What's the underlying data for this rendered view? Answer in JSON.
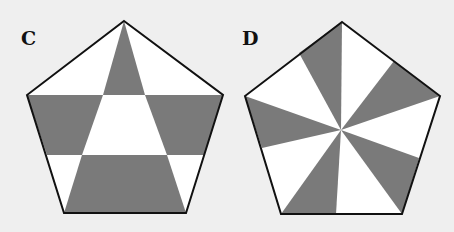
{
  "colors": {
    "background": "#efefef",
    "shaded": "#7a7a7a",
    "unshaded": "#ffffff",
    "outline": "#111111"
  },
  "figures": [
    {
      "label": "C",
      "shape": "regular pentagon",
      "description": "Pentagon divided by two horizontal lines and two lines from the top vertex to the bottom corners; shaded regions alternate in a checkerboard pattern",
      "vertices": [
        [
          124,
          21
        ],
        [
          223,
          95
        ],
        [
          186,
          213
        ],
        [
          64,
          213
        ],
        [
          27,
          95
        ]
      ],
      "shaded_regions": [
        [
          [
            124,
            21
          ],
          [
            145,
            95
          ],
          [
            103,
            95
          ]
        ],
        [
          [
            27,
            95
          ],
          [
            103,
            95
          ],
          [
            82,
            155
          ],
          [
            47,
            155
          ]
        ],
        [
          [
            145,
            95
          ],
          [
            223,
            95
          ],
          [
            204,
            155
          ],
          [
            167,
            155
          ]
        ],
        [
          [
            82,
            155
          ],
          [
            167,
            155
          ],
          [
            186,
            213
          ],
          [
            64,
            213
          ]
        ]
      ]
    },
    {
      "label": "D",
      "shape": "regular pentagon",
      "description": "Pentagon divided into wedges radiating from the center; five gray wedges each span from a vertex (or edge point) to a point partway along the adjacent edge, forming a pinwheel pattern",
      "vertices": [
        [
          342,
          22
        ],
        [
          440,
          96
        ],
        [
          402,
          214
        ],
        [
          281,
          214
        ],
        [
          245,
          96
        ]
      ],
      "center": [
        341,
        130
      ],
      "shaded_regions": [
        [
          [
            341,
            130
          ],
          [
            342,
            22
          ],
          [
            299,
            53
          ]
        ],
        [
          [
            341,
            130
          ],
          [
            440,
            96
          ],
          [
            394,
            61
          ]
        ],
        [
          [
            341,
            130
          ],
          [
            419,
            158
          ],
          [
            402,
            214
          ]
        ],
        [
          [
            341,
            130
          ],
          [
            336,
            214
          ],
          [
            281,
            214
          ]
        ],
        [
          [
            341,
            130
          ],
          [
            262,
            148
          ],
          [
            245,
            96
          ]
        ]
      ]
    }
  ]
}
